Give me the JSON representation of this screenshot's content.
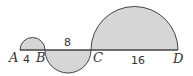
{
  "diagram": {
    "type": "semicircles-on-line",
    "fill_color": "#d6d6d6",
    "stroke_color": "#444444",
    "points": [
      {
        "label": "A",
        "x": 20
      },
      {
        "label": "B",
        "x": 45
      },
      {
        "label": "C",
        "x": 91
      },
      {
        "label": "D",
        "x": 178
      }
    ],
    "segments": [
      {
        "from": "A",
        "to": "B",
        "length_label": "4",
        "semicircle": "above"
      },
      {
        "from": "B",
        "to": "C",
        "length_label": "8",
        "semicircle": "below"
      },
      {
        "from": "C",
        "to": "D",
        "length_label": "16",
        "semicircle": "above"
      }
    ]
  }
}
